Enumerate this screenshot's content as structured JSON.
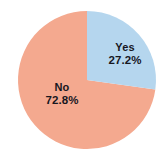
{
  "chart_data": {
    "type": "pie",
    "title": "",
    "title_note": "title is cropped off at the top edge and illegible",
    "categories": [
      "Yes",
      "No"
    ],
    "values": [
      27.2,
      72.8
    ],
    "value_unit": "%",
    "slices": [
      {
        "label": "Yes",
        "value": 27.2,
        "value_text": "27.2%",
        "color": "#b5d6ee",
        "start_angle_deg": 0,
        "end_angle_deg": 97.9
      },
      {
        "label": "No",
        "value": 72.8,
        "value_text": "72.8%",
        "color": "#f4a98f",
        "start_angle_deg": 97.9,
        "end_angle_deg": 360
      }
    ],
    "legend": "none",
    "data_labels": "inside slices",
    "grid": false,
    "xlabel": "",
    "ylabel": ""
  },
  "labels": {
    "yes": {
      "name": "Yes",
      "value": "27.2%"
    },
    "no": {
      "name": "No",
      "value": "72.8%"
    }
  },
  "colors": {
    "yes_slice": "#b5d6ee",
    "no_slice": "#f4a98f",
    "background": "#ffffff",
    "label_text": "#17171f"
  }
}
